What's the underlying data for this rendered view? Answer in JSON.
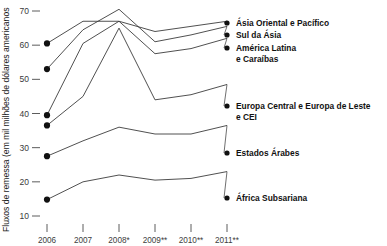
{
  "chart_data": {
    "type": "line",
    "title": "",
    "xlabel": "",
    "ylabel": "Fluxos de remessa (em mil milhões de dólares americanos",
    "categories": [
      "2006",
      "2007",
      "2008*",
      "2009**",
      "2010**",
      "2011**"
    ],
    "yticks": [
      70,
      60,
      50,
      40,
      30,
      20,
      10
    ],
    "ylim": [
      8,
      72
    ],
    "grid": false,
    "legend_position": "right-inline-labels",
    "series": [
      {
        "name": "Ásia Oriental e Pacífico",
        "values": [
          60.5,
          67.0,
          67.0,
          64.0,
          65.5,
          67.0
        ]
      },
      {
        "name": "Sul da Ásia",
        "values": [
          53.0,
          64.5,
          70.5,
          61.0,
          63.0,
          65.5
        ]
      },
      {
        "name": "América Latina e Caraíbas",
        "values": [
          39.5,
          60.5,
          67.0,
          57.5,
          59.0,
          62.0
        ]
      },
      {
        "name": "Europa Central e Europa de Leste e CEI",
        "values": [
          36.5,
          45.0,
          65.0,
          44.0,
          45.5,
          48.5
        ]
      },
      {
        "name": "Estados Árabes",
        "values": [
          27.5,
          32.0,
          36.0,
          34.0,
          34.0,
          36.5
        ]
      },
      {
        "name": "África Subsariana",
        "values": [
          14.8,
          20.0,
          22.0,
          20.5,
          21.0,
          23.0
        ]
      }
    ]
  },
  "axis": {
    "y_tick_labels": [
      "70",
      "60",
      "50",
      "40",
      "30",
      "20",
      "10"
    ],
    "x_tick_labels": [
      "2006",
      "2007",
      "2008*",
      "2009**",
      "2010**",
      "2011**"
    ],
    "y_axis_title": "Fluxos de remessa (em mil milhões de dólares americanos"
  },
  "series_labels": [
    {
      "line1": "Ásia Oriental e Pacífico",
      "line2": ""
    },
    {
      "line1": "Sul da Ásia",
      "line2": ""
    },
    {
      "line1": "América Latina",
      "line2": "e Caraíbas"
    },
    {
      "line1": "Europa Central e Europa de Leste",
      "line2": "e CEI"
    },
    {
      "line1": "Estados Árabes",
      "line2": ""
    },
    {
      "line1": "África Subsariana",
      "line2": ""
    }
  ],
  "colors": {
    "line": "#3c3c3c",
    "marker": "#111111",
    "text": "#111111",
    "tick_text": "#3a3a3a",
    "background": "#ffffff"
  }
}
